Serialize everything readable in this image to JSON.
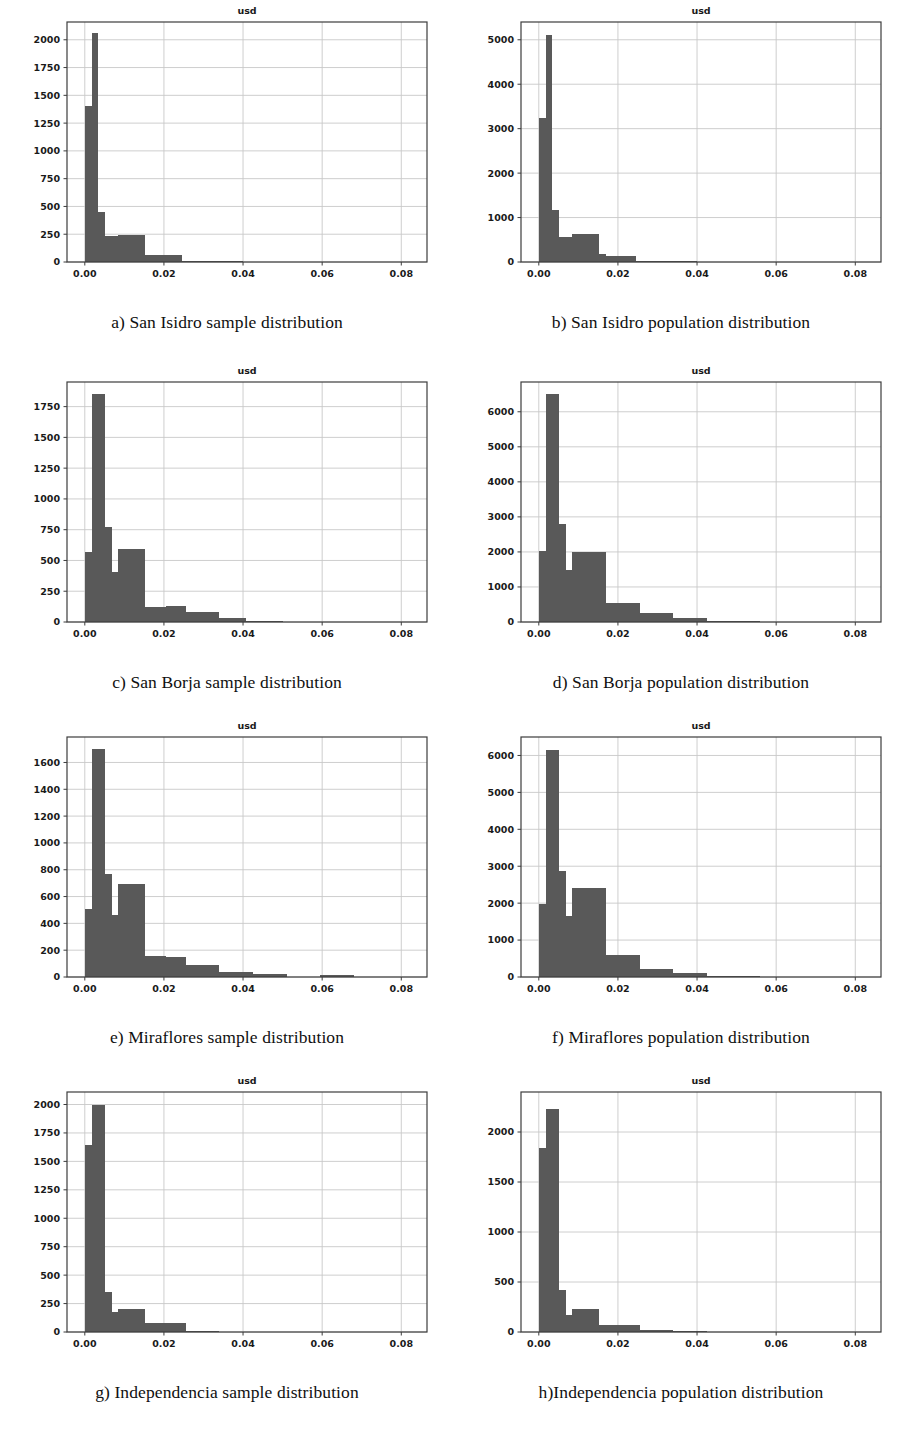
{
  "figure": {
    "axis_title": "usd",
    "bar_color": "#595959",
    "grid_color": "#c8c8c8",
    "frame_color": "#3c3c3c",
    "background": "#ffffff"
  },
  "panels": [
    {
      "id": "panel-a",
      "caption": "a) San Isidro sample distribution",
      "chart_data": {
        "type": "bar",
        "title": "usd",
        "xlabel": "",
        "ylabel": "",
        "xlim": [
          -0.0045,
          0.0865
        ],
        "ylim": [
          0,
          2160
        ],
        "xticks": [
          0.0,
          0.02,
          0.04,
          0.06,
          0.08
        ],
        "xtick_labels": [
          "0.00",
          "0.02",
          "0.04",
          "0.06",
          "0.08"
        ],
        "yticks": [
          0,
          250,
          500,
          750,
          1000,
          1250,
          1500,
          1750,
          2000
        ],
        "ytick_labels": [
          "0",
          "250",
          "500",
          "750",
          "1000",
          "1250",
          "1500",
          "1750",
          "2000"
        ],
        "grid": true,
        "bin_edges": [
          0.0,
          0.0017,
          0.0034,
          0.0051,
          0.0085,
          0.0119,
          0.0153,
          0.017,
          0.0204,
          0.0246,
          0.0255
        ],
        "bars": [
          {
            "x0": 0.0,
            "x1": 0.0017,
            "value": 1400
          },
          {
            "x0": 0.0017,
            "x1": 0.0034,
            "value": 2060
          },
          {
            "x0": 0.0034,
            "x1": 0.0051,
            "value": 450
          },
          {
            "x0": 0.0051,
            "x1": 0.0085,
            "value": 230
          },
          {
            "x0": 0.0085,
            "x1": 0.0153,
            "value": 245
          },
          {
            "x0": 0.0153,
            "x1": 0.0246,
            "value": 60
          },
          {
            "x0": 0.0246,
            "x1": 0.04,
            "value": 8
          }
        ]
      }
    },
    {
      "id": "panel-b",
      "caption": "b) San Isidro population distribution",
      "chart_data": {
        "type": "bar",
        "title": "usd",
        "xlabel": "",
        "ylabel": "",
        "xlim": [
          -0.0045,
          0.0865
        ],
        "ylim": [
          0,
          5400
        ],
        "xticks": [
          0.0,
          0.02,
          0.04,
          0.06,
          0.08
        ],
        "xtick_labels": [
          "0.00",
          "0.02",
          "0.04",
          "0.06",
          "0.08"
        ],
        "yticks": [
          0,
          1000,
          2000,
          3000,
          4000,
          5000
        ],
        "ytick_labels": [
          "0",
          "1000",
          "2000",
          "3000",
          "4000",
          "5000"
        ],
        "grid": true,
        "bin_edges": [
          0.0,
          0.0017,
          0.0034,
          0.0051,
          0.0085,
          0.0119,
          0.0153,
          0.017,
          0.0204,
          0.0246,
          0.0255
        ],
        "bars": [
          {
            "x0": 0.0,
            "x1": 0.0017,
            "value": 3230
          },
          {
            "x0": 0.0017,
            "x1": 0.0034,
            "value": 5100
          },
          {
            "x0": 0.0034,
            "x1": 0.0051,
            "value": 1170
          },
          {
            "x0": 0.0051,
            "x1": 0.0085,
            "value": 560
          },
          {
            "x0": 0.0085,
            "x1": 0.0153,
            "value": 630
          },
          {
            "x0": 0.0153,
            "x1": 0.017,
            "value": 170
          },
          {
            "x0": 0.017,
            "x1": 0.0246,
            "value": 145
          },
          {
            "x0": 0.0246,
            "x1": 0.04,
            "value": 20
          }
        ]
      }
    },
    {
      "id": "panel-c",
      "caption": "c) San Borja sample distribution",
      "chart_data": {
        "type": "bar",
        "title": "usd",
        "xlabel": "",
        "ylabel": "",
        "xlim": [
          -0.0045,
          0.0865
        ],
        "ylim": [
          0,
          1950
        ],
        "xticks": [
          0.0,
          0.02,
          0.04,
          0.06,
          0.08
        ],
        "xtick_labels": [
          "0.00",
          "0.02",
          "0.04",
          "0.06",
          "0.08"
        ],
        "yticks": [
          0,
          250,
          500,
          750,
          1000,
          1250,
          1500,
          1750
        ],
        "ytick_labels": [
          "0",
          "250",
          "500",
          "750",
          "1000",
          "1250",
          "1500",
          "1750"
        ],
        "grid": true,
        "bin_edges": [
          0.0,
          0.0017,
          0.0034,
          0.0051,
          0.0068,
          0.0085,
          0.0153,
          0.0204,
          0.0255,
          0.034,
          0.0408
        ],
        "bars": [
          {
            "x0": 0.0,
            "x1": 0.0017,
            "value": 570
          },
          {
            "x0": 0.0017,
            "x1": 0.0051,
            "value": 1855
          },
          {
            "x0": 0.0051,
            "x1": 0.0068,
            "value": 775
          },
          {
            "x0": 0.0068,
            "x1": 0.0085,
            "value": 410
          },
          {
            "x0": 0.0085,
            "x1": 0.0153,
            "value": 595
          },
          {
            "x0": 0.0153,
            "x1": 0.0204,
            "value": 125
          },
          {
            "x0": 0.0204,
            "x1": 0.0255,
            "value": 130
          },
          {
            "x0": 0.0255,
            "x1": 0.034,
            "value": 85
          },
          {
            "x0": 0.034,
            "x1": 0.0408,
            "value": 30
          },
          {
            "x0": 0.0408,
            "x1": 0.05,
            "value": 6
          }
        ]
      }
    },
    {
      "id": "panel-d",
      "caption": "d) San Borja population distribution",
      "chart_data": {
        "type": "bar",
        "title": "usd",
        "xlabel": "",
        "ylabel": "",
        "xlim": [
          -0.0045,
          0.0865
        ],
        "ylim": [
          0,
          6850
        ],
        "xticks": [
          0.0,
          0.02,
          0.04,
          0.06,
          0.08
        ],
        "xtick_labels": [
          "0.00",
          "0.02",
          "0.04",
          "0.06",
          "0.08"
        ],
        "yticks": [
          0,
          1000,
          2000,
          3000,
          4000,
          5000,
          6000
        ],
        "ytick_labels": [
          "0",
          "1000",
          "2000",
          "3000",
          "4000",
          "5000",
          "6000"
        ],
        "grid": true,
        "bin_edges": [
          0.0,
          0.0017,
          0.0034,
          0.0051,
          0.0068,
          0.0085,
          0.017,
          0.0255,
          0.034,
          0.0425
        ],
        "bars": [
          {
            "x0": 0.0,
            "x1": 0.0017,
            "value": 2040
          },
          {
            "x0": 0.0017,
            "x1": 0.0051,
            "value": 6500
          },
          {
            "x0": 0.0051,
            "x1": 0.0068,
            "value": 2790
          },
          {
            "x0": 0.0068,
            "x1": 0.0085,
            "value": 1490
          },
          {
            "x0": 0.0085,
            "x1": 0.017,
            "value": 2010
          },
          {
            "x0": 0.017,
            "x1": 0.0255,
            "value": 530
          },
          {
            "x0": 0.0255,
            "x1": 0.034,
            "value": 260
          },
          {
            "x0": 0.034,
            "x1": 0.0425,
            "value": 110
          },
          {
            "x0": 0.0425,
            "x1": 0.056,
            "value": 20
          }
        ]
      }
    },
    {
      "id": "panel-e",
      "caption": "e) Miraflores sample distribution",
      "chart_data": {
        "type": "bar",
        "title": "usd",
        "xlabel": "",
        "ylabel": "",
        "xlim": [
          -0.0045,
          0.0865
        ],
        "ylim": [
          0,
          1790
        ],
        "xticks": [
          0.0,
          0.02,
          0.04,
          0.06,
          0.08
        ],
        "xtick_labels": [
          "0.00",
          "0.02",
          "0.04",
          "0.06",
          "0.08"
        ],
        "yticks": [
          0,
          200,
          400,
          600,
          800,
          1000,
          1200,
          1400,
          1600
        ],
        "ytick_labels": [
          "0",
          "200",
          "400",
          "600",
          "800",
          "1000",
          "1200",
          "1400",
          "1600"
        ],
        "grid": true,
        "bin_edges": [
          0.0,
          0.0017,
          0.0034,
          0.0051,
          0.0068,
          0.0085,
          0.0153,
          0.0204,
          0.0255,
          0.034,
          0.0425,
          0.051,
          0.0595,
          0.068
        ],
        "bars": [
          {
            "x0": 0.0,
            "x1": 0.0017,
            "value": 510
          },
          {
            "x0": 0.0017,
            "x1": 0.0051,
            "value": 1700
          },
          {
            "x0": 0.0051,
            "x1": 0.0068,
            "value": 765
          },
          {
            "x0": 0.0068,
            "x1": 0.0085,
            "value": 465
          },
          {
            "x0": 0.0085,
            "x1": 0.0153,
            "value": 690
          },
          {
            "x0": 0.0153,
            "x1": 0.0204,
            "value": 160
          },
          {
            "x0": 0.0204,
            "x1": 0.0255,
            "value": 150
          },
          {
            "x0": 0.0255,
            "x1": 0.034,
            "value": 90
          },
          {
            "x0": 0.034,
            "x1": 0.0425,
            "value": 40
          },
          {
            "x0": 0.0425,
            "x1": 0.051,
            "value": 25
          },
          {
            "x0": 0.0595,
            "x1": 0.068,
            "value": 18
          }
        ]
      }
    },
    {
      "id": "panel-f",
      "caption": "f) Miraflores population distribution",
      "chart_data": {
        "type": "bar",
        "title": "usd",
        "xlabel": "",
        "ylabel": "",
        "xlim": [
          -0.0045,
          0.0865
        ],
        "ylim": [
          0,
          6500
        ],
        "xticks": [
          0.0,
          0.02,
          0.04,
          0.06,
          0.08
        ],
        "xtick_labels": [
          "0.00",
          "0.02",
          "0.04",
          "0.06",
          "0.08"
        ],
        "yticks": [
          0,
          1000,
          2000,
          3000,
          4000,
          5000,
          6000
        ],
        "ytick_labels": [
          "0",
          "1000",
          "2000",
          "3000",
          "4000",
          "5000",
          "6000"
        ],
        "grid": true,
        "bin_edges": [
          0.0,
          0.0017,
          0.0034,
          0.0051,
          0.0068,
          0.0085,
          0.017,
          0.0255,
          0.034,
          0.0425
        ],
        "bars": [
          {
            "x0": 0.0,
            "x1": 0.0017,
            "value": 1990
          },
          {
            "x0": 0.0017,
            "x1": 0.0051,
            "value": 6150
          },
          {
            "x0": 0.0051,
            "x1": 0.0068,
            "value": 2870
          },
          {
            "x0": 0.0068,
            "x1": 0.0085,
            "value": 1660
          },
          {
            "x0": 0.0085,
            "x1": 0.017,
            "value": 2400
          },
          {
            "x0": 0.017,
            "x1": 0.0255,
            "value": 590
          },
          {
            "x0": 0.0255,
            "x1": 0.034,
            "value": 230
          },
          {
            "x0": 0.034,
            "x1": 0.0425,
            "value": 110
          },
          {
            "x0": 0.0425,
            "x1": 0.056,
            "value": 25
          }
        ]
      }
    },
    {
      "id": "panel-g",
      "caption": "g) Independencia sample distribution",
      "chart_data": {
        "type": "bar",
        "title": "usd",
        "xlabel": "",
        "ylabel": "",
        "xlim": [
          -0.0045,
          0.0865
        ],
        "ylim": [
          0,
          2110
        ],
        "xticks": [
          0.0,
          0.02,
          0.04,
          0.06,
          0.08
        ],
        "xtick_labels": [
          "0.00",
          "0.02",
          "0.04",
          "0.06",
          "0.08"
        ],
        "yticks": [
          0,
          250,
          500,
          750,
          1000,
          1250,
          1500,
          1750,
          2000
        ],
        "ytick_labels": [
          "0",
          "250",
          "500",
          "750",
          "1000",
          "1250",
          "1500",
          "1750",
          "2000"
        ],
        "grid": true,
        "bin_edges": [
          0.0,
          0.0017,
          0.0034,
          0.0051,
          0.0068,
          0.0085,
          0.0153,
          0.0204,
          0.0255,
          0.034
        ],
        "bars": [
          {
            "x0": 0.0,
            "x1": 0.0017,
            "value": 1645
          },
          {
            "x0": 0.0017,
            "x1": 0.0034,
            "value": 2000
          },
          {
            "x0": 0.0034,
            "x1": 0.0051,
            "value": 2000
          },
          {
            "x0": 0.0051,
            "x1": 0.0068,
            "value": 355
          },
          {
            "x0": 0.0068,
            "x1": 0.0085,
            "value": 175
          },
          {
            "x0": 0.0085,
            "x1": 0.0153,
            "value": 200
          },
          {
            "x0": 0.0153,
            "x1": 0.0204,
            "value": 75
          },
          {
            "x0": 0.0204,
            "x1": 0.0255,
            "value": 80
          },
          {
            "x0": 0.0255,
            "x1": 0.034,
            "value": 12
          }
        ]
      }
    },
    {
      "id": "panel-h",
      "caption": "h)Independencia population distribution",
      "chart_data": {
        "type": "bar",
        "title": "usd",
        "xlabel": "",
        "ylabel": "",
        "xlim": [
          -0.0045,
          0.0865
        ],
        "ylim": [
          0,
          2400
        ],
        "xticks": [
          0.0,
          0.02,
          0.04,
          0.06,
          0.08
        ],
        "xtick_labels": [
          "0.00",
          "0.02",
          "0.04",
          "0.06",
          "0.08"
        ],
        "yticks": [
          0,
          500,
          1000,
          1500,
          2000
        ],
        "ytick_labels": [
          "0",
          "500",
          "1000",
          "1500",
          "2000"
        ],
        "grid": true,
        "bin_edges": [
          0.0,
          0.0017,
          0.0034,
          0.0051,
          0.0068,
          0.0085,
          0.0153,
          0.0255,
          0.034,
          0.0425
        ],
        "bars": [
          {
            "x0": 0.0,
            "x1": 0.0017,
            "value": 1840
          },
          {
            "x0": 0.0017,
            "x1": 0.0051,
            "value": 2230
          },
          {
            "x0": 0.0051,
            "x1": 0.0068,
            "value": 425
          },
          {
            "x0": 0.0068,
            "x1": 0.0085,
            "value": 175
          },
          {
            "x0": 0.0085,
            "x1": 0.0153,
            "value": 235
          },
          {
            "x0": 0.0153,
            "x1": 0.0255,
            "value": 75
          },
          {
            "x0": 0.0255,
            "x1": 0.034,
            "value": 22
          },
          {
            "x0": 0.034,
            "x1": 0.0425,
            "value": 10
          }
        ]
      }
    }
  ]
}
